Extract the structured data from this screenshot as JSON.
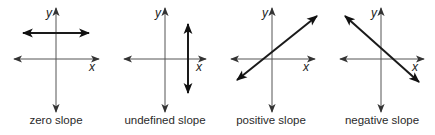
{
  "figure": {
    "colors": {
      "axis": "#444444",
      "line": "#1a1a1a",
      "text": "#2a2a2a",
      "background": "#ffffff"
    },
    "panels": [
      {
        "id": "zero",
        "caption": "zero slope",
        "x_label": "x",
        "y_label": "y",
        "line_type": "horizontal"
      },
      {
        "id": "undefined",
        "caption": "undefined slope",
        "x_label": "x",
        "y_label": "y",
        "line_type": "vertical"
      },
      {
        "id": "positive",
        "caption": "positive slope",
        "x_label": "x",
        "y_label": "y",
        "line_type": "rising"
      },
      {
        "id": "negative",
        "caption": "negative slope",
        "x_label": "x",
        "y_label": "y",
        "line_type": "falling"
      }
    ]
  }
}
